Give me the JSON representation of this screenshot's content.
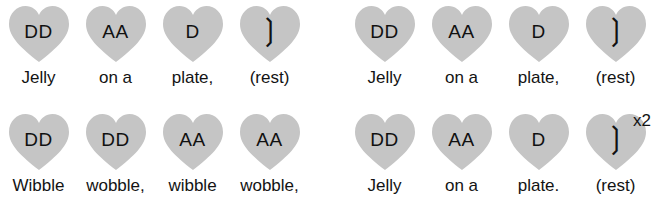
{
  "page": {
    "background_color": "#ffffff",
    "heart_fill_color": "#c5c5c5",
    "text_color": "#131313",
    "rest_glyph": "❳"
  },
  "repeat": {
    "label": "x2"
  },
  "rows": [
    {
      "name": "row-1",
      "groups": [
        {
          "name": "row-1-group-1",
          "beats": [
            {
              "rhythm": "DD",
              "lyric": "Jelly",
              "is_rest": false
            },
            {
              "rhythm": "AA",
              "lyric": "on a",
              "is_rest": false
            },
            {
              "rhythm": "D",
              "lyric": "plate,",
              "is_rest": false
            },
            {
              "rhythm": "❳",
              "lyric": "(rest)",
              "is_rest": true
            }
          ]
        },
        {
          "name": "row-1-group-2",
          "beats": [
            {
              "rhythm": "DD",
              "lyric": "Jelly",
              "is_rest": false
            },
            {
              "rhythm": "AA",
              "lyric": "on a",
              "is_rest": false
            },
            {
              "rhythm": "D",
              "lyric": "plate,",
              "is_rest": false
            },
            {
              "rhythm": "❳",
              "lyric": "(rest)",
              "is_rest": true
            }
          ]
        }
      ]
    },
    {
      "name": "row-2",
      "groups": [
        {
          "name": "row-2-group-1",
          "beats": [
            {
              "rhythm": "DD",
              "lyric": "Wibble",
              "is_rest": false
            },
            {
              "rhythm": "DD",
              "lyric": "wobble,",
              "is_rest": false
            },
            {
              "rhythm": "AA",
              "lyric": "wibble",
              "is_rest": false
            },
            {
              "rhythm": "AA",
              "lyric": "wobble,",
              "is_rest": false
            }
          ]
        },
        {
          "name": "row-2-group-2",
          "beats": [
            {
              "rhythm": "DD",
              "lyric": "Jelly",
              "is_rest": false
            },
            {
              "rhythm": "AA",
              "lyric": "on a",
              "is_rest": false
            },
            {
              "rhythm": "D",
              "lyric": "plate.",
              "is_rest": false
            },
            {
              "rhythm": "❳",
              "lyric": "(rest)",
              "is_rest": true
            }
          ]
        }
      ]
    }
  ]
}
